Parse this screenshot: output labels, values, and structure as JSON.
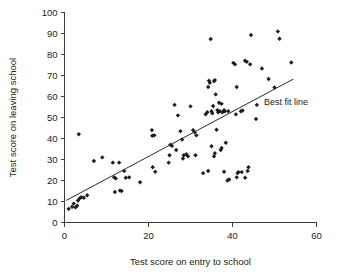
{
  "chart_data": {
    "type": "scatter",
    "title": "",
    "xlabel": "Test score on entry to school",
    "ylabel": "Test score on leaving school",
    "xlim": [
      0,
      60
    ],
    "ylim": [
      0,
      100
    ],
    "xticks": [
      0,
      20,
      40,
      60
    ],
    "yticks": [
      0,
      10,
      20,
      30,
      40,
      50,
      60,
      70,
      80,
      90,
      100
    ],
    "xtick_labels": [
      "0",
      "20",
      "40",
      "60"
    ],
    "ytick_labels": [
      "0",
      "10",
      "20",
      "30",
      "40",
      "50",
      "60",
      "70",
      "80",
      "90",
      "100"
    ],
    "grid": false,
    "legend": {
      "position": "inside-right",
      "entries": [
        "Best fit line"
      ]
    },
    "annotations": [
      {
        "text": "Best fit line",
        "x": 47.5,
        "y": 56
      }
    ],
    "series": [
      {
        "name": "Pupils",
        "marker": "diamond",
        "color": "#1c1c1c",
        "points": [
          [
            1.0,
            6.5
          ],
          [
            1.8,
            7.5
          ],
          [
            2.2,
            9.0
          ],
          [
            2.6,
            7.2
          ],
          [
            3.0,
            8.0
          ],
          [
            3.2,
            10.5
          ],
          [
            3.6,
            11.5
          ],
          [
            4.0,
            12.0
          ],
          [
            3.4,
            42.0
          ],
          [
            4.6,
            11.8
          ],
          [
            5.4,
            13.0
          ],
          [
            7.0,
            29.3
          ],
          [
            9.0,
            31.0
          ],
          [
            11.5,
            28.5
          ],
          [
            11.8,
            21.5
          ],
          [
            12.2,
            21.0
          ],
          [
            12.0,
            14.5
          ],
          [
            13.2,
            15.2
          ],
          [
            13.6,
            15.0
          ],
          [
            13.0,
            28.5
          ],
          [
            14.6,
            21.3
          ],
          [
            15.4,
            21.5
          ],
          [
            14.2,
            24.5
          ],
          [
            18.0,
            19.2
          ],
          [
            20.8,
            44.0
          ],
          [
            20.9,
            41.3
          ],
          [
            21.4,
            41.5
          ],
          [
            21.0,
            26.3
          ],
          [
            21.6,
            24.2
          ],
          [
            25.2,
            37.0
          ],
          [
            25.6,
            36.5
          ],
          [
            24.8,
            28.5
          ],
          [
            25.0,
            32.0
          ],
          [
            26.2,
            56.0
          ],
          [
            26.6,
            34.5
          ],
          [
            27.0,
            51.0
          ],
          [
            27.6,
            43.5
          ],
          [
            28.0,
            39.5
          ],
          [
            28.4,
            32.0
          ],
          [
            28.2,
            30.5
          ],
          [
            29.0,
            32.5
          ],
          [
            29.4,
            31.5
          ],
          [
            30.0,
            55.3
          ],
          [
            30.6,
            44.0
          ],
          [
            31.0,
            43.0
          ],
          [
            31.4,
            41.5
          ],
          [
            31.2,
            32.0
          ],
          [
            33.0,
            23.5
          ],
          [
            33.6,
            51.5
          ],
          [
            34.0,
            52.5
          ],
          [
            34.2,
            64.5
          ],
          [
            34.4,
            67.5
          ],
          [
            34.6,
            66.5
          ],
          [
            34.8,
            87.4
          ],
          [
            35.0,
            53.0
          ],
          [
            35.2,
            52.0
          ],
          [
            35.4,
            55.5
          ],
          [
            35.0,
            36.3
          ],
          [
            35.6,
            67.3
          ],
          [
            35.8,
            67.8
          ],
          [
            35.6,
            31.5
          ],
          [
            35.8,
            33.0
          ],
          [
            34.2,
            24.5
          ],
          [
            36.0,
            61.0
          ],
          [
            36.4,
            53.5
          ],
          [
            36.6,
            52.5
          ],
          [
            36.2,
            44.2
          ],
          [
            36.8,
            57.0
          ],
          [
            37.0,
            53.0
          ],
          [
            37.4,
            56.5
          ],
          [
            37.2,
            34.5
          ],
          [
            37.4,
            35.5
          ],
          [
            37.6,
            52.5
          ],
          [
            38.0,
            53.5
          ],
          [
            38.2,
            53.0
          ],
          [
            38.4,
            38.0
          ],
          [
            38.0,
            24.2
          ],
          [
            38.8,
            20.0
          ],
          [
            39.0,
            53.0
          ],
          [
            39.2,
            20.5
          ],
          [
            40.2,
            76.0
          ],
          [
            40.6,
            75.3
          ],
          [
            40.8,
            51.5
          ],
          [
            41.0,
            64.5
          ],
          [
            41.2,
            23.5
          ],
          [
            41.4,
            24.0
          ],
          [
            41.0,
            21.5
          ],
          [
            42.0,
            53.0
          ],
          [
            42.4,
            53.3
          ],
          [
            42.2,
            24.0
          ],
          [
            43.0,
            77.0
          ],
          [
            43.4,
            76.5
          ],
          [
            43.0,
            21.3
          ],
          [
            43.6,
            24.5
          ],
          [
            43.8,
            26.3
          ],
          [
            44.4,
            89.3
          ],
          [
            44.2,
            75.3
          ],
          [
            45.6,
            49.3
          ],
          [
            45.8,
            56.0
          ],
          [
            47.0,
            73.3
          ],
          [
            48.6,
            68.3
          ],
          [
            50.0,
            64.3
          ],
          [
            50.8,
            91.0
          ],
          [
            51.2,
            87.5
          ],
          [
            54.0,
            76.2
          ]
        ]
      }
    ],
    "fit_line": {
      "label": "Best fit line",
      "x_start": 0.4,
      "y_start": 10.5,
      "x_end": 54.5,
      "y_end": 68.3
    }
  },
  "axis": {
    "x_title": "Test score on entry to school",
    "y_title": "Test score on leaving school"
  },
  "colors": {
    "marker": "#1c1c1c",
    "axis": "#3c3c3c",
    "fit_line": "#2b2b2b",
    "background": "#ffffff"
  }
}
